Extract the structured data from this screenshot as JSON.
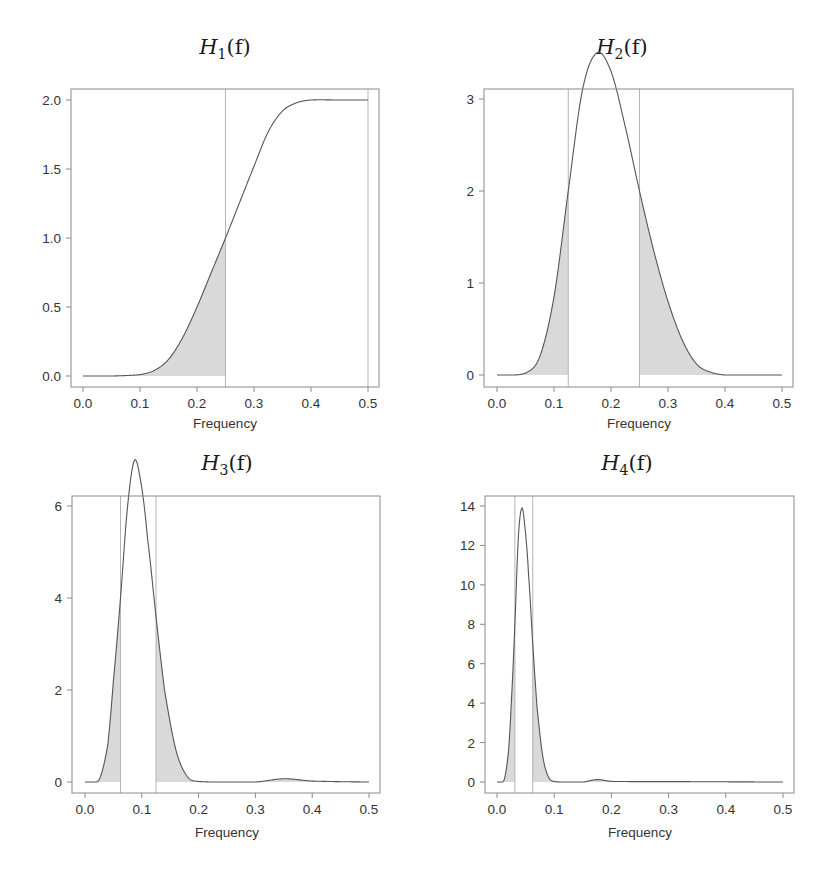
{
  "figure": {
    "panels": [
      {
        "id": "h1",
        "title_main": "H",
        "title_sub": "1",
        "title_arg": "(f)",
        "xlabel": "Frequency",
        "ylabel": "",
        "xticks": [
          "0.0",
          "0.1",
          "0.2",
          "0.3",
          "0.4",
          "0.5"
        ],
        "yticks": [
          "0.0",
          "0.5",
          "1.0",
          "1.5",
          "2.0"
        ],
        "vlines": [
          0.25,
          0.5
        ]
      },
      {
        "id": "h2",
        "title_main": "H",
        "title_sub": "2",
        "title_arg": "(f)",
        "xlabel": "Frequency",
        "ylabel": "",
        "xticks": [
          "0.0",
          "0.1",
          "0.2",
          "0.3",
          "0.4",
          "0.5"
        ],
        "yticks": [
          "0",
          "1",
          "2",
          "3"
        ],
        "vlines": [
          0.125,
          0.25
        ]
      },
      {
        "id": "h3",
        "title_main": "H",
        "title_sub": "3",
        "title_arg": "(f)",
        "xlabel": "Frequency",
        "ylabel": "",
        "xticks": [
          "0.0",
          "0.1",
          "0.2",
          "0.3",
          "0.4",
          "0.5"
        ],
        "yticks": [
          "0",
          "2",
          "4",
          "6"
        ],
        "vlines": [
          0.0625,
          0.125
        ]
      },
      {
        "id": "h4",
        "title_main": "H",
        "title_sub": "4",
        "title_arg": "(f)",
        "xlabel": "Frequency",
        "ylabel": "",
        "xticks": [
          "0.0",
          "0.1",
          "0.2",
          "0.3",
          "0.4",
          "0.5"
        ],
        "yticks": [
          "0",
          "2",
          "4",
          "6",
          "8",
          "10",
          "12",
          "14"
        ],
        "vlines": [
          0.03125,
          0.0625
        ]
      }
    ]
  },
  "chart_data": [
    {
      "type": "area",
      "title": "H_1(f)",
      "xlabel": "Frequency",
      "ylabel": "",
      "xlim": [
        0,
        0.5
      ],
      "ylim": [
        0,
        2.0
      ],
      "grid": false,
      "xticks": [
        0.0,
        0.1,
        0.2,
        0.3,
        0.4,
        0.5
      ],
      "yticks": [
        0.0,
        0.5,
        1.0,
        1.5,
        2.0
      ],
      "vertical_lines": [
        0.25,
        0.5
      ],
      "shaded_region": [
        [
          0.0,
          0.25
        ]
      ],
      "x": [
        0.0,
        0.05,
        0.1,
        0.125,
        0.15,
        0.175,
        0.2,
        0.225,
        0.25,
        0.275,
        0.3,
        0.325,
        0.35,
        0.375,
        0.4,
        0.45,
        0.5
      ],
      "values": [
        0.0,
        0.0,
        0.01,
        0.04,
        0.12,
        0.28,
        0.5,
        0.75,
        1.0,
        1.26,
        1.52,
        1.77,
        1.92,
        1.98,
        2.0,
        2.0,
        2.0
      ]
    },
    {
      "type": "area",
      "title": "H_2(f)",
      "xlabel": "Frequency",
      "ylabel": "",
      "xlim": [
        0,
        0.5
      ],
      "ylim": [
        0,
        3.5
      ],
      "grid": false,
      "xticks": [
        0.0,
        0.1,
        0.2,
        0.3,
        0.4,
        0.5
      ],
      "yticks": [
        0,
        1,
        2,
        3
      ],
      "vertical_lines": [
        0.125,
        0.25
      ],
      "shaded_region": [
        [
          0.0,
          0.125
        ],
        [
          0.25,
          0.5
        ]
      ],
      "x": [
        0.0,
        0.05,
        0.075,
        0.1,
        0.125,
        0.15,
        0.175,
        0.2,
        0.225,
        0.25,
        0.275,
        0.3,
        0.325,
        0.35,
        0.375,
        0.4,
        0.45,
        0.5
      ],
      "values": [
        0.0,
        0.02,
        0.2,
        0.85,
        2.0,
        3.1,
        3.5,
        3.3,
        2.7,
        2.0,
        1.35,
        0.8,
        0.38,
        0.12,
        0.03,
        0.0,
        0.0,
        0.0
      ]
    },
    {
      "type": "area",
      "title": "H_3(f)",
      "xlabel": "Frequency",
      "ylabel": "",
      "xlim": [
        0,
        0.5
      ],
      "ylim": [
        0,
        7.0
      ],
      "grid": false,
      "xticks": [
        0.0,
        0.1,
        0.2,
        0.3,
        0.4,
        0.5
      ],
      "yticks": [
        0,
        2,
        4,
        6
      ],
      "vertical_lines": [
        0.0625,
        0.125
      ],
      "shaded_region": [
        [
          0.0,
          0.0625
        ],
        [
          0.125,
          0.5
        ]
      ],
      "x": [
        0.0,
        0.025,
        0.04,
        0.05,
        0.0625,
        0.075,
        0.0875,
        0.1,
        0.11,
        0.125,
        0.14,
        0.16,
        0.18,
        0.2,
        0.3,
        0.35,
        0.4,
        0.5
      ],
      "values": [
        0.0,
        0.05,
        0.8,
        2.2,
        4.0,
        6.0,
        7.0,
        6.4,
        5.3,
        3.6,
        2.0,
        0.7,
        0.12,
        0.01,
        0.0,
        0.07,
        0.02,
        0.0
      ]
    },
    {
      "type": "area",
      "title": "H_4(f)",
      "xlabel": "Frequency",
      "ylabel": "",
      "xlim": [
        0,
        0.5
      ],
      "ylim": [
        0,
        14.0
      ],
      "grid": false,
      "xticks": [
        0.0,
        0.1,
        0.2,
        0.3,
        0.4,
        0.5
      ],
      "yticks": [
        0,
        2,
        4,
        6,
        8,
        10,
        12,
        14
      ],
      "vertical_lines": [
        0.03125,
        0.0625
      ],
      "shaded_region": [
        [
          0.0,
          0.03125
        ],
        [
          0.0625,
          0.5
        ]
      ],
      "x": [
        0.0,
        0.0125,
        0.02,
        0.025,
        0.03125,
        0.0375,
        0.04375,
        0.05,
        0.055,
        0.0625,
        0.07,
        0.08,
        0.09,
        0.1,
        0.15,
        0.175,
        0.2,
        0.3,
        0.5
      ],
      "values": [
        0.0,
        0.1,
        1.5,
        4.0,
        8.0,
        12.5,
        13.9,
        12.6,
        10.6,
        7.0,
        3.8,
        1.3,
        0.25,
        0.02,
        0.0,
        0.12,
        0.03,
        0.02,
        0.0
      ]
    }
  ]
}
